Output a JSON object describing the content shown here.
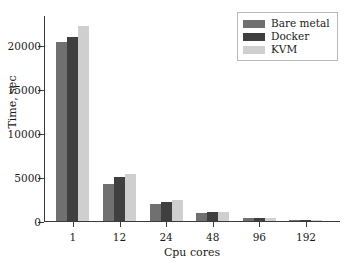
{
  "chart_data": {
    "type": "bar",
    "title": "",
    "xlabel": "Cpu cores",
    "ylabel": "Time, sec",
    "categories": [
      "1",
      "12",
      "24",
      "48",
      "96",
      "192"
    ],
    "series": [
      {
        "name": "Bare metal",
        "color": "#707070",
        "values": [
          20340,
          4200,
          1950,
          870,
          300,
          110
        ]
      },
      {
        "name": "Docker",
        "color": "#3f3f3f",
        "values": [
          20900,
          4960,
          2180,
          1000,
          360,
          130
        ]
      },
      {
        "name": "KVM",
        "color": "#cfcfcf",
        "values": [
          22160,
          5340,
          2340,
          1060,
          360,
          120
        ]
      }
    ],
    "ylim": [
      0,
      23400
    ],
    "yticks": [
      0,
      5000,
      10000,
      15000,
      20000
    ],
    "ytick_labels": [
      "0",
      "5000",
      "10000",
      "15000",
      "20000"
    ],
    "xtick_labels": [
      "1",
      "12",
      "24",
      "48",
      "96",
      "192"
    ],
    "grid": false,
    "legend_position": "upper right",
    "legend_entries": [
      "Bare metal",
      "Docker",
      "KVM"
    ]
  }
}
